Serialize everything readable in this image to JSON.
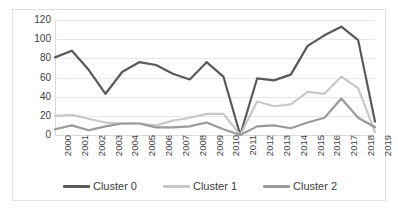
{
  "chart_data": {
    "type": "line",
    "title": "",
    "xlabel": "",
    "ylabel": "",
    "ylim": [
      0,
      120
    ],
    "yticks": [
      0,
      20,
      40,
      60,
      80,
      100,
      120
    ],
    "grid": true,
    "legend_position": "bottom",
    "categories": [
      "2000",
      "2001",
      "2002",
      "2003",
      "2004",
      "2005",
      "2006",
      "2007",
      "2008",
      "2009",
      "2010",
      "2011",
      "2012",
      "2013",
      "2014",
      "2015",
      "2016",
      "2017",
      "2018",
      "2019"
    ],
    "series": [
      {
        "name": "Cluster 0",
        "color": "#595959",
        "values": [
          81,
          88,
          68,
          43,
          66,
          76,
          73,
          64,
          58,
          76,
          61,
          0,
          59,
          57,
          63,
          93,
          104,
          113,
          99,
          14
        ]
      },
      {
        "name": "Cluster 1",
        "color": "#c8c8c8",
        "values": [
          20,
          21,
          17,
          13,
          12,
          12,
          10,
          15,
          18,
          22,
          22,
          0,
          35,
          30,
          32,
          45,
          43,
          61,
          49,
          3
        ]
      },
      {
        "name": "Cluster 2",
        "color": "#9a9a9a",
        "values": [
          6,
          10,
          5,
          9,
          12,
          12,
          8,
          8,
          9,
          13,
          6,
          0,
          9,
          10,
          7,
          13,
          18,
          38,
          18,
          8
        ]
      }
    ]
  },
  "legend": {
    "items": [
      {
        "label": "Cluster 0"
      },
      {
        "label": "Cluster 1"
      },
      {
        "label": "Cluster 2"
      }
    ]
  },
  "axis": {
    "y_labels": [
      "120",
      "100",
      "80",
      "60",
      "40",
      "20",
      "0"
    ],
    "x_labels": [
      "2000",
      "2001",
      "2002",
      "2003",
      "2004",
      "2005",
      "2006",
      "2007",
      "2008",
      "2009",
      "2010",
      "2011",
      "2012",
      "2013",
      "2014",
      "2015",
      "2016",
      "2017",
      "2018",
      "2019"
    ]
  }
}
